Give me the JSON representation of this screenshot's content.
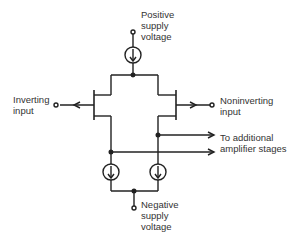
{
  "diagram": {
    "type": "differential amplifier input stage schematic",
    "labels": {
      "positive_supply": "Positive\nsupply\nvoltage",
      "negative_supply": "Negative\nsupply\nvoltage",
      "inverting_input": "Inverting\ninput",
      "noninverting_input": "Noninverting\ninput",
      "output": "To additional\namplifier stages"
    },
    "colors": {
      "line": "#222222",
      "text": "#333333",
      "background": "#ffffff"
    },
    "components": [
      {
        "name": "top-current-source",
        "kind": "current source"
      },
      {
        "name": "left-transistor",
        "kind": "FET"
      },
      {
        "name": "right-transistor",
        "kind": "FET"
      },
      {
        "name": "bottom-left-current-source",
        "kind": "current source"
      },
      {
        "name": "bottom-right-current-source",
        "kind": "current source"
      }
    ]
  }
}
